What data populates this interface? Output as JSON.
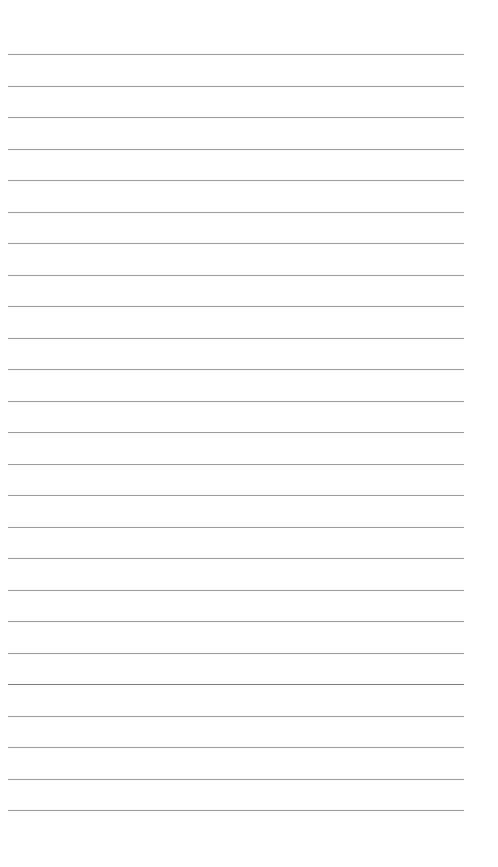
{
  "page": {
    "type": "blank lined paper",
    "line_count": 25,
    "line_color": "#9a9a9a",
    "emphasized_line_color": "#7a7a7a",
    "emphasized_line_index": 20,
    "lines_y": [
      54,
      86,
      117,
      149,
      180,
      212,
      243,
      275,
      306,
      338,
      369,
      401,
      432,
      464,
      495,
      527,
      558,
      590,
      621,
      653,
      684,
      716,
      747,
      779,
      810
    ],
    "line_x_start": 8,
    "line_x_end": 464
  }
}
